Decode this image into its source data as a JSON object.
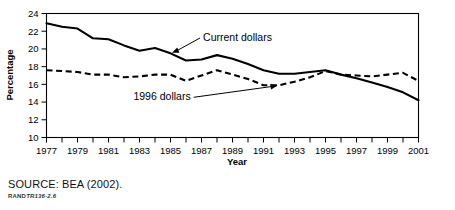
{
  "figure": {
    "source_note": "SOURCE: BEA (2002).",
    "rand_prefix": "RAND",
    "rand_number": "TR136-2.6"
  },
  "chart_data": {
    "type": "line",
    "title": "",
    "xlabel": "Year",
    "ylabel": "Percentage",
    "xlim": [
      1977,
      2001
    ],
    "ylim": [
      10,
      24
    ],
    "ytick_step": 2,
    "yticks": [
      10,
      12,
      14,
      16,
      18,
      20,
      22,
      24
    ],
    "ytick_labels": [
      "10",
      "12",
      "14",
      "16",
      "18",
      "20",
      "22",
      "24"
    ],
    "xticks": [
      1977,
      1978,
      1979,
      1980,
      1981,
      1982,
      1983,
      1984,
      1985,
      1986,
      1987,
      1988,
      1989,
      1990,
      1991,
      1992,
      1993,
      1994,
      1995,
      1996,
      1997,
      1998,
      1999,
      2000,
      2001
    ],
    "xtick_labels_shown": [
      "1977",
      "1979",
      "1981",
      "1983",
      "1985",
      "1987",
      "1989",
      "1991",
      "1993",
      "1995",
      "1997",
      "1999",
      "2001"
    ],
    "grid": false,
    "legend_position": "inline-annotations",
    "x": [
      1977,
      1978,
      1979,
      1980,
      1981,
      1982,
      1983,
      1984,
      1985,
      1986,
      1987,
      1988,
      1989,
      1990,
      1991,
      1992,
      1993,
      1994,
      1995,
      1996,
      1997,
      1998,
      1999,
      2000,
      2001
    ],
    "series": [
      {
        "name": "Current dollars",
        "style": "solid",
        "annotation": "Current dollars",
        "values": [
          22.9,
          22.5,
          22.3,
          21.2,
          21.1,
          20.4,
          19.8,
          20.1,
          19.5,
          18.7,
          18.8,
          19.3,
          18.9,
          18.3,
          17.6,
          17.2,
          17.2,
          17.4,
          17.6,
          17.1,
          16.7,
          16.2,
          15.7,
          15.1,
          14.2
        ]
      },
      {
        "name": "1996 dollars",
        "style": "dashed",
        "annotation": "1996 dollars",
        "values": [
          17.6,
          17.5,
          17.4,
          17.1,
          17.1,
          16.8,
          16.9,
          17.1,
          17.1,
          16.4,
          17.0,
          17.6,
          17.1,
          16.6,
          15.9,
          15.9,
          16.3,
          16.8,
          17.5,
          17.1,
          17.0,
          16.9,
          17.1,
          17.3,
          16.4
        ]
      }
    ],
    "annotations": [
      {
        "label": "Current dollars",
        "target_year": 1985,
        "text_x": 1987.1,
        "text_y": 20.9
      },
      {
        "label": "1996 dollars",
        "target_year": 1992,
        "text_x": 1986.3,
        "text_y": 14.2
      }
    ]
  }
}
